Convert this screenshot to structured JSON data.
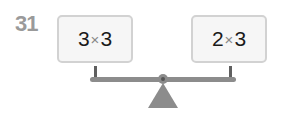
{
  "question": {
    "number": "31"
  },
  "balance": {
    "left": {
      "a": "3",
      "op": "×",
      "b": "3"
    },
    "right": {
      "a": "2",
      "op": "×",
      "b": "3"
    }
  },
  "colors": {
    "card_bg": "#f6f6f6",
    "card_border": "#d2d2d2",
    "scale": "#8c8c8c",
    "number": "#9a9a9a"
  }
}
